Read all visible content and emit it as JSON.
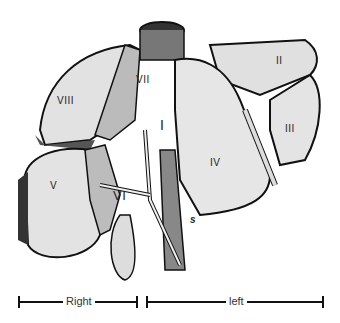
{
  "figure": {
    "segments": [
      {
        "id": "II",
        "label": "II"
      },
      {
        "id": "III",
        "label": "III"
      },
      {
        "id": "IV",
        "label": "IV"
      },
      {
        "id": "V",
        "label": "V"
      },
      {
        "id": "VI",
        "label": "VI"
      },
      {
        "id": "VII",
        "label": "VII"
      },
      {
        "id": "VIII",
        "label": "VIII"
      },
      {
        "id": "I",
        "label": "I"
      }
    ],
    "annotation": "s",
    "scale": {
      "right_label": "Right",
      "left_label": "left"
    }
  }
}
